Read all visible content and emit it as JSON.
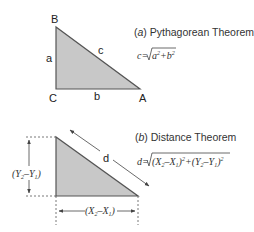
{
  "panel_a": {
    "caption_prefix": "(",
    "caption_letter": "a",
    "caption_rest": ") Pythagorean Theorem",
    "formula_lhs": "c=",
    "formula_radicand_a": "a",
    "formula_radicand_plus": "+",
    "formula_radicand_b": "b",
    "formula_exp": "2",
    "vertices": {
      "B": "B",
      "C": "C",
      "A": "A"
    },
    "sides": {
      "a": "a",
      "b": "b",
      "c": "c"
    }
  },
  "panel_b": {
    "caption_prefix": "(",
    "caption_letter": "b",
    "caption_rest": ") Distance Theorem",
    "formula_lhs": "d=",
    "formula_term1": "(X",
    "formula_sub2": "2",
    "formula_minus": "–X",
    "formula_sub1": "1",
    "formula_close": ")",
    "formula_exp": "2",
    "formula_plus": "+",
    "formula_term2": "(Y",
    "formula_minus2": "–Y",
    "hyp_label": "d",
    "vertical_label": {
      "open": "(Y",
      "sub2": "2",
      "minus": "–Y",
      "sub1": "1",
      "close": ")"
    },
    "horizontal_label": {
      "open": "(X",
      "sub2": "2",
      "minus": "–X",
      "sub1": "1",
      "close": ")"
    }
  },
  "colors": {
    "fill": "#c8c8c8",
    "stroke": "#555555",
    "text": "#222222"
  }
}
